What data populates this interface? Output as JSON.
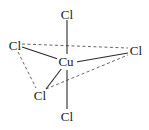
{
  "diagram": {
    "type": "molecular-structure",
    "center_atom": {
      "label": "Cu",
      "x": 65,
      "y": 63
    },
    "ligands": [
      {
        "id": "top",
        "label": "Cl",
        "x": 67,
        "y": 15
      },
      {
        "id": "left",
        "label": "Cl",
        "x": 14,
        "y": 47
      },
      {
        "id": "right",
        "label": "Cl",
        "x": 136,
        "y": 52
      },
      {
        "id": "lower-left",
        "label": "Cl",
        "x": 40,
        "y": 97
      },
      {
        "id": "bottom",
        "label": "Cl",
        "x": 67,
        "y": 118
      }
    ],
    "solid_bonds": [
      [
        "center",
        "top"
      ],
      [
        "center",
        "left"
      ],
      [
        "center",
        "right"
      ],
      [
        "center",
        "lower-left"
      ],
      [
        "center",
        "bottom"
      ]
    ],
    "dashed_edges": [
      [
        "left",
        "right"
      ],
      [
        "left",
        "lower-left"
      ],
      [
        "lower-left",
        "right"
      ]
    ],
    "colors": {
      "text": "#1a1a1a",
      "bond": "#2a2a2a",
      "dash": "#555555"
    }
  }
}
